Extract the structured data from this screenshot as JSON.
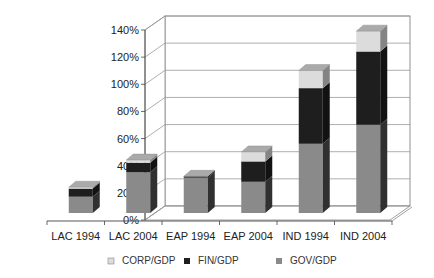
{
  "chart_data": {
    "type": "bar",
    "stacked": true,
    "style": "3d-column",
    "title": "",
    "xlabel": "",
    "ylabel": "",
    "ylim": [
      0,
      140
    ],
    "yticks": [
      0,
      20,
      40,
      60,
      80,
      100,
      120,
      140
    ],
    "ytick_labels": [
      "0%",
      "20%",
      "40%",
      "60%",
      "80%",
      "100%",
      "120%",
      "140%"
    ],
    "grid": true,
    "legend_position": "bottom",
    "categories": [
      "LAC 1994",
      "LAC 2004",
      "EAP 1994",
      "EAP 2004",
      "IND 1994",
      "IND 2004"
    ],
    "series": [
      {
        "name": "GOV/GDP",
        "color": "#8a8a8a",
        "values": [
          12,
          30,
          26,
          23,
          51,
          65
        ]
      },
      {
        "name": "FIN/GDP",
        "color": "#1e1e1e",
        "values": [
          6,
          7,
          1,
          15,
          41,
          54
        ]
      },
      {
        "name": "CORP/GDP",
        "color": "#dcdcdc",
        "values": [
          1,
          2,
          0,
          7,
          13,
          15
        ]
      }
    ],
    "legend_order": [
      "CORP/GDP",
      "FIN/GDP",
      "GOV/GDP"
    ]
  }
}
